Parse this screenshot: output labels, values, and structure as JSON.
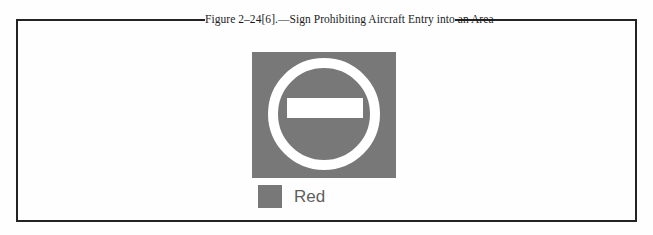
{
  "figure": {
    "caption": "Figure 2–24[6].—Sign Prohibiting Aircraft Entry into an Area",
    "border_color": "#232323",
    "background_color": "#fefefe"
  },
  "sign": {
    "name": "no-entry-sign",
    "shape": "square",
    "fill_color": "#787878",
    "symbol": "white-ring-with-horizontal-bar",
    "symbol_color": "#ffffff",
    "meaning": "Aircraft entry prohibited"
  },
  "legend": {
    "items": [
      {
        "label": "Red",
        "swatch_color": "#787878",
        "text_color": "#5e5e5e"
      }
    ]
  }
}
